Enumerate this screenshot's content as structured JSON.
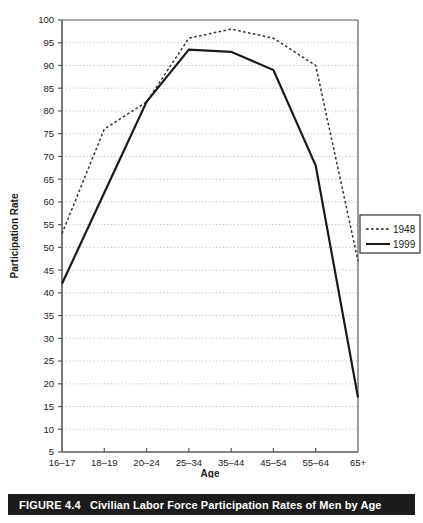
{
  "figure": {
    "number": "FIGURE 4.4",
    "caption": "Civilian Labor Force Participation Rates of Men by Age"
  },
  "chart_data": {
    "type": "line",
    "title": "",
    "xlabel": "Age",
    "ylabel": "Participation Rate",
    "categories": [
      "16–17",
      "18–19",
      "20–24",
      "25–34",
      "35–44",
      "45–54",
      "55–64",
      "65+"
    ],
    "ylim": [
      5,
      100
    ],
    "ytick_step": 5,
    "yticks": [
      5,
      10,
      15,
      20,
      25,
      30,
      35,
      40,
      45,
      50,
      55,
      60,
      65,
      70,
      75,
      80,
      85,
      90,
      95,
      100
    ],
    "grid": true,
    "grid_style": "dotted-horizontal",
    "legend_position": "right",
    "series": [
      {
        "name": "1948",
        "style": "dotted",
        "color": "#333333",
        "values": [
          53,
          76,
          82,
          96,
          98,
          96,
          90,
          47
        ]
      },
      {
        "name": "1999",
        "style": "solid",
        "color": "#1a1a1a",
        "values": [
          42,
          62,
          82,
          93.5,
          93,
          89,
          68,
          17
        ]
      }
    ]
  },
  "legend": {
    "items": [
      {
        "label": "1948",
        "style": "dotted"
      },
      {
        "label": "1999",
        "style": "solid"
      }
    ]
  }
}
